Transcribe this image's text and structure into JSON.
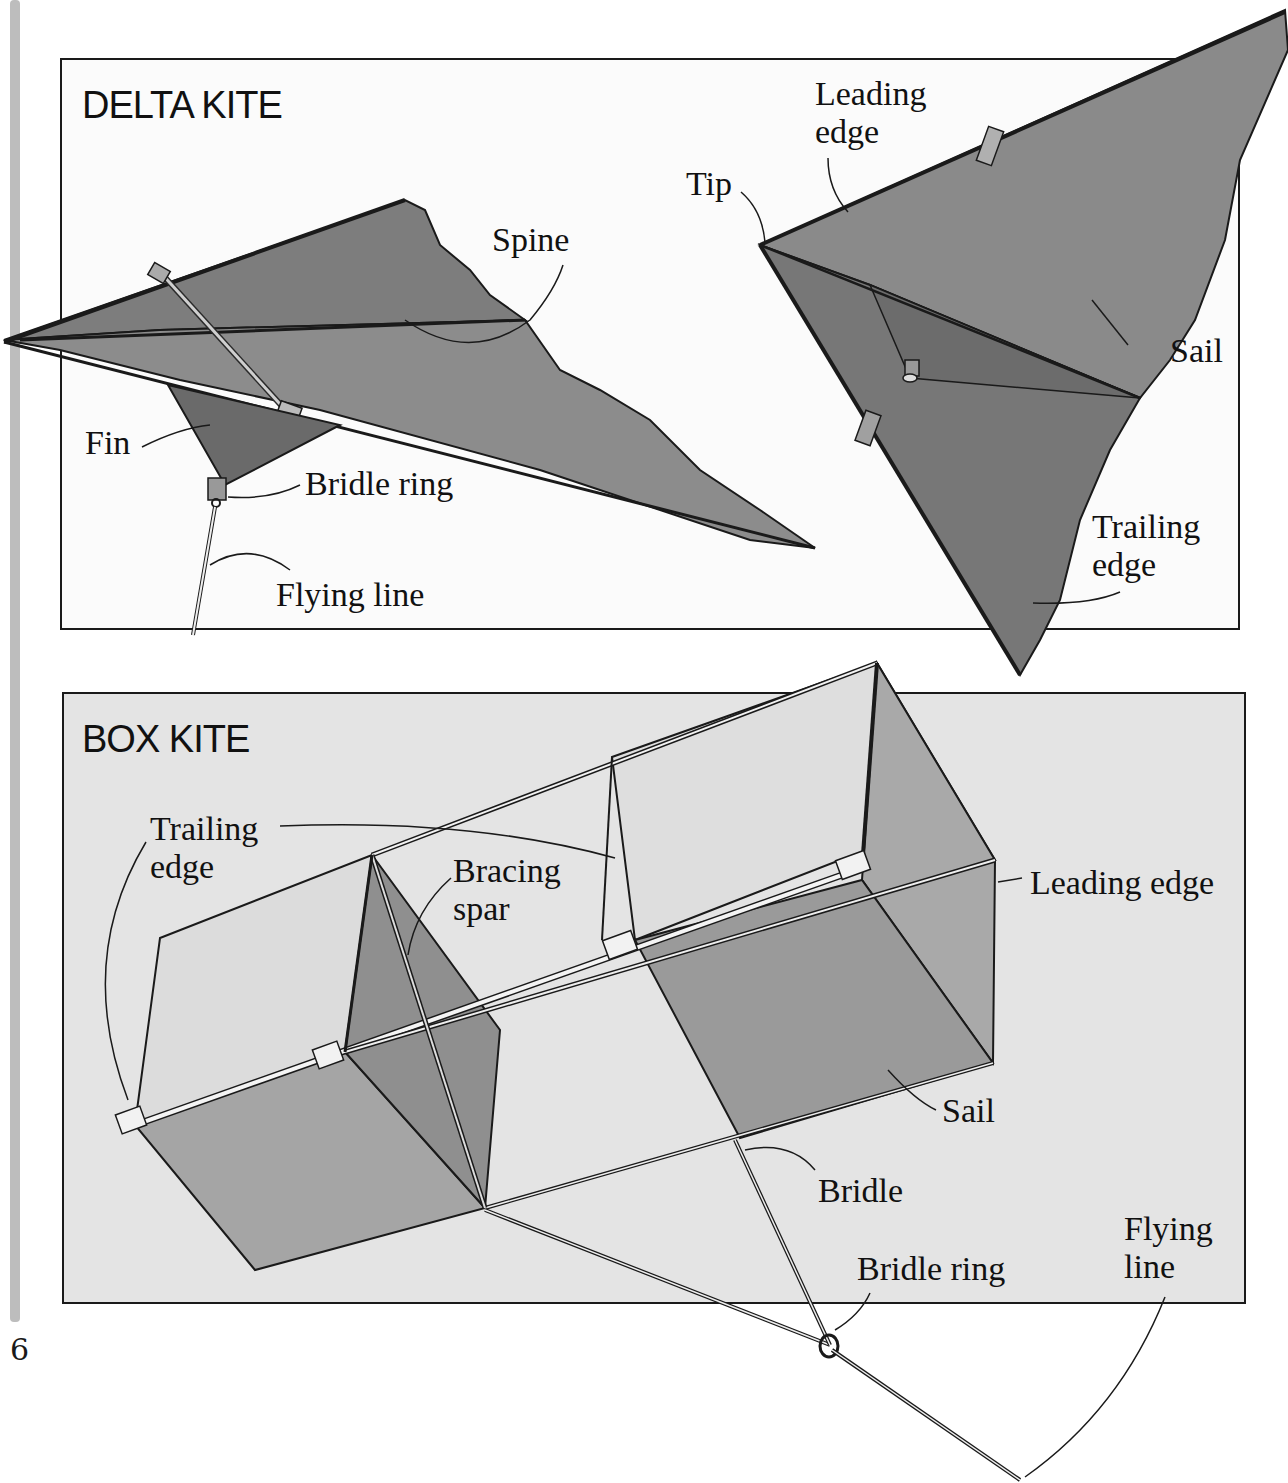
{
  "page": {
    "page_number": "6",
    "colors": {
      "page_bg": "#ffffff",
      "delta_panel_bg": "#fbfbfb",
      "box_panel_bg": "#e4e4e4",
      "margin_bar": "#bdbdbd",
      "sail_dark": "#7a7a7a",
      "sail_mid": "#8e8e8e",
      "sail_light": "#d6d6d6",
      "outline": "#1a1a1a"
    }
  },
  "delta_kite": {
    "title": "DELTA KITE",
    "left_view_labels": {
      "spine": "Spine",
      "fin": "Fin",
      "bridle_ring": "Bridle ring",
      "flying_line": "Flying line"
    },
    "right_view_labels": {
      "leading_edge": "Leading\nedge",
      "tip": "Tip",
      "sail": "Sail",
      "trailing_edge": "Trailing\nedge"
    }
  },
  "box_kite": {
    "title": "BOX KITE",
    "labels": {
      "trailing_edge": "Trailing\nedge",
      "bracing_spar": "Bracing\nspar",
      "leading_edge": "Leading edge",
      "sail": "Sail",
      "bridle": "Bridle",
      "bridle_ring": "Bridle ring",
      "flying_line": "Flying\nline"
    }
  }
}
